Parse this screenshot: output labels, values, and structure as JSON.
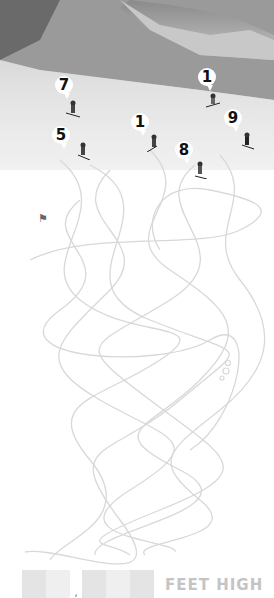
{
  "puzzle": {
    "type": "maze",
    "theme": "skiing",
    "skiers": [
      {
        "label": "7",
        "x": 64,
        "y": 78
      },
      {
        "label": "1",
        "x": 204,
        "y": 70
      },
      {
        "label": "5",
        "x": 55,
        "y": 128
      },
      {
        "label": "1",
        "x": 135,
        "y": 115
      },
      {
        "label": "9",
        "x": 232,
        "y": 111
      },
      {
        "label": "8",
        "x": 178,
        "y": 142
      }
    ],
    "finish_flag": "⚑",
    "answer": {
      "boxes": 5,
      "separator": ",",
      "unit_label": "FEET HIGH"
    }
  },
  "colors": {
    "maze_line": "#d8d8d8",
    "badge_bg": "#ffffff",
    "label_gray": "#c4c4c4"
  }
}
